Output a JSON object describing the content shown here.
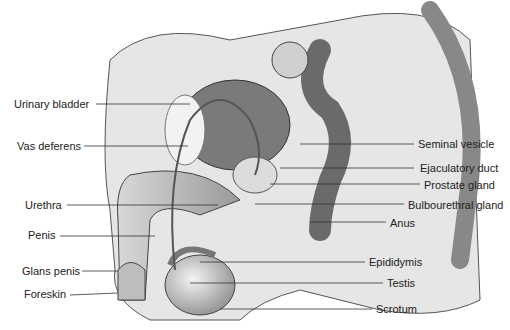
{
  "diagram": {
    "labels_left": [
      {
        "id": "urinary-bladder",
        "text": "Urinary bladder",
        "x": 14,
        "y": 98,
        "lx1": 96,
        "lx2": 190,
        "ly": 104
      },
      {
        "id": "vas-deferens",
        "text": "Vas deferens",
        "x": 17,
        "y": 140,
        "lx1": 84,
        "lx2": 188,
        "ly": 146
      },
      {
        "id": "urethra",
        "text": "Urethra",
        "x": 25,
        "y": 199,
        "lx1": 67,
        "lx2": 218,
        "ly": 205
      },
      {
        "id": "penis",
        "text": "Penis",
        "x": 28,
        "y": 229,
        "lx1": 60,
        "lx2": 155,
        "ly": 236
      },
      {
        "id": "glans-penis",
        "text": "Glans penis",
        "x": 22,
        "y": 265,
        "lx1": 82,
        "lx2": 118,
        "ly": 271
      },
      {
        "id": "foreskin",
        "text": "Foreskin",
        "x": 24,
        "y": 288,
        "lx1": 70,
        "lx2": 118,
        "ly": 295
      }
    ],
    "labels_right": [
      {
        "id": "seminal-vesicle",
        "text": "Seminal vesicle",
        "x": 418,
        "y": 166,
        "lx1": 320,
        "lx2": 414,
        "ly": 172
      },
      {
        "id": "ejaculatory-duct",
        "text": "Ejaculatory duct",
        "x": 420,
        "y": 162,
        "lx1": 280,
        "lx2": 414,
        "ly": 168
      },
      {
        "id": "prostate-gland",
        "text": "Prostate gland",
        "x": 424,
        "y": 179,
        "lx1": 270,
        "lx2": 420,
        "ly": 184
      },
      {
        "id": "bulbourethral-gland",
        "text": "Bulbourethral gland",
        "x": 408,
        "y": 199,
        "lx1": 255,
        "lx2": 404,
        "ly": 204
      },
      {
        "id": "anus",
        "text": "Anus",
        "x": 390,
        "y": 217,
        "lx1": 310,
        "lx2": 386,
        "ly": 222
      },
      {
        "id": "epididymis",
        "text": "Epididymis",
        "x": 369,
        "y": 255,
        "lx1": 200,
        "lx2": 365,
        "ly": 262
      },
      {
        "id": "testis",
        "text": "Testis",
        "x": 387,
        "y": 276,
        "lx1": 190,
        "lx2": 383,
        "ly": 283
      },
      {
        "id": "scrotum",
        "text": "Scrotum",
        "x": 376,
        "y": 303,
        "lx1": 220,
        "lx2": 372,
        "ly": 309
      }
    ]
  }
}
